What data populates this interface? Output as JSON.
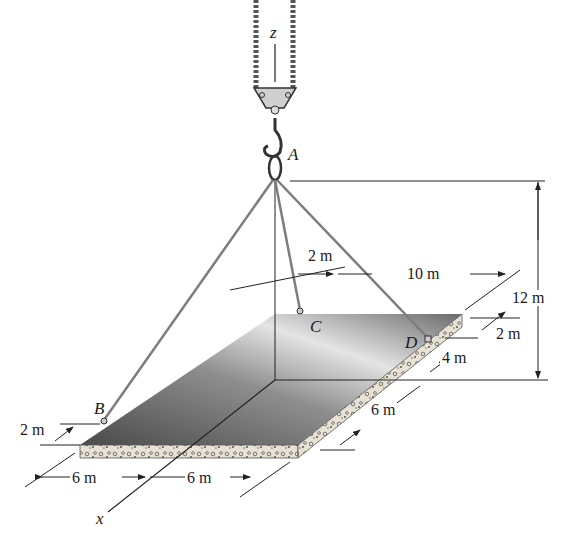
{
  "figure": {
    "axes": {
      "z": "z",
      "x": "x"
    },
    "points": {
      "A": "A",
      "B": "B",
      "C": "C",
      "D": "D"
    },
    "dimensions": {
      "height_A": "12 m",
      "C_offset": "2 m",
      "C_to_D_width": "10 m",
      "D_edge_offset": "2 m",
      "D_to_origin": "4 m",
      "slab_depth_front": "6 m",
      "B_edge_offset": "2 m",
      "front_left_width": "6 m",
      "front_right_width": "6 m"
    },
    "colors": {
      "slab_top_dark": "#555555",
      "slab_top_light": "#d9d9d9",
      "slab_edge": "#e6e0d2",
      "cable": "#8a8a8a",
      "line": "#222222"
    }
  }
}
